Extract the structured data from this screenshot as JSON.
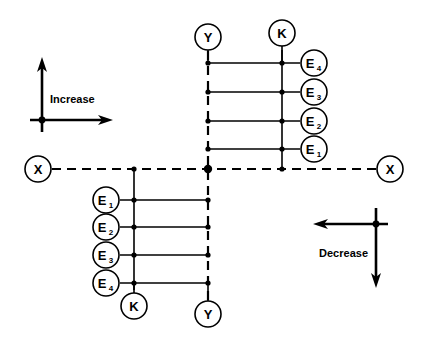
{
  "diagram": {
    "colors": {
      "stroke": "#000000",
      "background": "#ffffff",
      "node_fill": "#ffffff"
    },
    "axes": {
      "horizontal": {
        "name": "X axis",
        "style": "dashed",
        "left_terminal_label": "X",
        "right_terminal_label": "X",
        "y": 169,
        "x_start": 52,
        "x_end": 376
      },
      "vertical": {
        "name": "Y axis",
        "style": "dashed",
        "top_terminal_label": "Y",
        "bottom_terminal_label": "Y",
        "x": 208,
        "y_start": 51,
        "y_end": 300
      },
      "origin": {
        "x": 208,
        "y": 169
      }
    },
    "terminals": [
      {
        "id": "x-left",
        "label": "X",
        "cx": 38,
        "cy": 169,
        "r": 13
      },
      {
        "id": "x-right",
        "label": "X",
        "cx": 390,
        "cy": 169,
        "r": 13
      },
      {
        "id": "y-top",
        "label": "Y",
        "cx": 208,
        "cy": 37,
        "r": 13
      },
      {
        "id": "y-bottom",
        "label": "Y",
        "cx": 208,
        "cy": 314,
        "r": 13
      }
    ],
    "rails": [
      {
        "id": "k-upper",
        "label": "K",
        "quadrant": "upper-right",
        "x": 282,
        "y_top": 50,
        "y_bottom": 169,
        "circle": {
          "cx": 282,
          "cy": 33,
          "r": 13
        }
      },
      {
        "id": "k-lower",
        "label": "K",
        "quadrant": "lower-left",
        "x": 134,
        "y_top": 169,
        "y_bottom": 290,
        "circle": {
          "cx": 134,
          "cy": 306,
          "r": 13
        }
      }
    ],
    "upper_right_branch": {
      "description": "Four rungs from Y axis to K rail, terminating in E nodes",
      "rung_x_start": 208,
      "rung_x_end": 300,
      "node_circle_r": 13,
      "node_circle_cx": 314,
      "rungs": [
        {
          "label": "E",
          "subscript": "4",
          "y": 63
        },
        {
          "label": "E",
          "subscript": "3",
          "y": 92
        },
        {
          "label": "E",
          "subscript": "2",
          "y": 121
        },
        {
          "label": "E",
          "subscript": "1",
          "y": 149
        }
      ]
    },
    "lower_left_branch": {
      "description": "Four rungs from E nodes through K rail to Y axis",
      "rung_x_start": 120,
      "rung_x_end": 208,
      "node_circle_r": 13,
      "node_circle_cx": 106,
      "rungs": [
        {
          "label": "E",
          "subscript": "1",
          "y": 200
        },
        {
          "label": "E",
          "subscript": "2",
          "y": 227
        },
        {
          "label": "E",
          "subscript": "3",
          "y": 255
        },
        {
          "label": "E",
          "subscript": "4",
          "y": 283
        }
      ]
    },
    "legends": [
      {
        "id": "increase",
        "label": "Increase",
        "hub": {
          "x": 42,
          "y": 120
        },
        "arrow_directions": [
          "up",
          "right"
        ],
        "text_position": {
          "x": 50,
          "y": 99
        }
      },
      {
        "id": "decrease",
        "label": "Decrease",
        "hub": {
          "x": 376,
          "y": 224
        },
        "arrow_directions": [
          "left",
          "down"
        ],
        "text_position": {
          "x": 368,
          "y": 253
        }
      }
    ]
  }
}
